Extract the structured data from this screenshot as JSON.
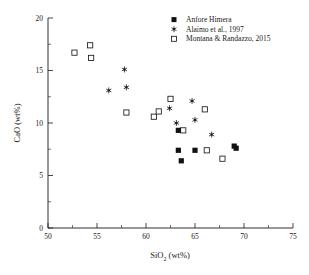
{
  "chart_data": {
    "type": "scatter",
    "title": "",
    "xlabel": "SiO2 (wt%)",
    "xlabel_main": "SiO",
    "xlabel_sub": "2",
    "xlabel_unit": " (wt%)",
    "ylabel": "CaO (wt%)",
    "xlim": [
      50,
      75
    ],
    "ylim": [
      0,
      20
    ],
    "xticks": [
      50,
      55,
      60,
      65,
      70,
      75
    ],
    "xtick_labels": [
      "50",
      "55",
      "60",
      "65",
      "70",
      "75"
    ],
    "yticks": [
      0,
      5,
      10,
      15,
      20
    ],
    "ytick_labels": [
      "0",
      "5",
      "10",
      "15",
      "20"
    ],
    "x_minor_ticks": [
      52.5,
      57.5,
      62.5,
      67.5,
      72.5
    ],
    "y_minor_ticks": [
      2.5,
      7.5,
      12.5,
      17.5
    ],
    "grid": false,
    "legend_position": "top-right",
    "series": [
      {
        "name": "Anfore Himera",
        "marker": "filled-square",
        "color": "#111111",
        "points": [
          [
            63.3,
            9.3
          ],
          [
            63.3,
            7.4
          ],
          [
            63.6,
            6.4
          ],
          [
            65.0,
            7.4
          ],
          [
            69.0,
            7.8
          ],
          [
            69.2,
            7.6
          ]
        ]
      },
      {
        "name": "Alaimo et al., 1997",
        "marker": "asterisk",
        "color": "#1a1a1a",
        "points": [
          [
            56.2,
            13.1
          ],
          [
            57.8,
            15.1
          ],
          [
            58.0,
            13.4
          ],
          [
            62.4,
            11.4
          ],
          [
            63.1,
            10.0
          ],
          [
            64.7,
            12.1
          ],
          [
            65.0,
            10.3
          ],
          [
            66.7,
            8.9
          ]
        ]
      },
      {
        "name": "Montana & Randazzo, 2015",
        "marker": "open-square",
        "color": "#1a1a1a",
        "points": [
          [
            52.7,
            16.7
          ],
          [
            54.3,
            17.4
          ],
          [
            54.4,
            16.2
          ],
          [
            58.0,
            11.0
          ],
          [
            60.8,
            10.6
          ],
          [
            61.3,
            11.1
          ],
          [
            62.5,
            12.3
          ],
          [
            63.8,
            9.3
          ],
          [
            66.0,
            11.3
          ],
          [
            66.2,
            7.4
          ],
          [
            67.8,
            6.6
          ]
        ]
      }
    ]
  },
  "legend": {
    "items": [
      {
        "label": "Anfore Himera",
        "marker": "filled-square"
      },
      {
        "label": "Alaimo et al., 1997",
        "marker": "asterisk"
      },
      {
        "label": "Montana & Randazzo, 2015",
        "marker": "open-square"
      }
    ]
  },
  "axes": {
    "x_title_main": "SiO",
    "x_title_sub": "2",
    "x_title_rest": " (wt%)",
    "y_title": "CaO (wt%)"
  }
}
